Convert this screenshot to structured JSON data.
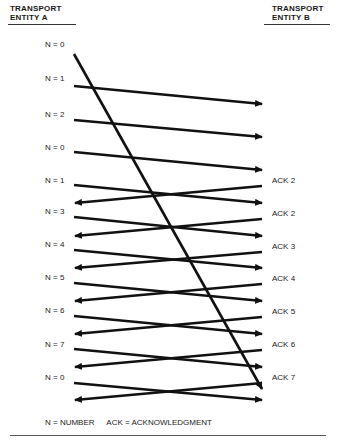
{
  "header": {
    "entity_a": [
      "TRANSPORT",
      "ENTITY A"
    ],
    "entity_b": [
      "TRANSPORT",
      "ENTITY B"
    ]
  },
  "sequence_labels": [
    "N = 0",
    "N = 1",
    "N = 2",
    "N = 0",
    "N = 1",
    "N = 3",
    "N = 4",
    "N = 5",
    "N = 6",
    "N = 7",
    "N = 0"
  ],
  "ack_labels": [
    "ACK 2",
    "ACK 2",
    "ACK 3",
    "ACK 4",
    "ACK 5",
    "ACK 6",
    "ACK 7"
  ],
  "legend": {
    "n_def": "N = NUMBER",
    "ack_def": "ACK = ACKNOWLEDGMENT"
  },
  "colors": {
    "line": "#111111",
    "text": "#222222",
    "background": "#ffffff"
  }
}
